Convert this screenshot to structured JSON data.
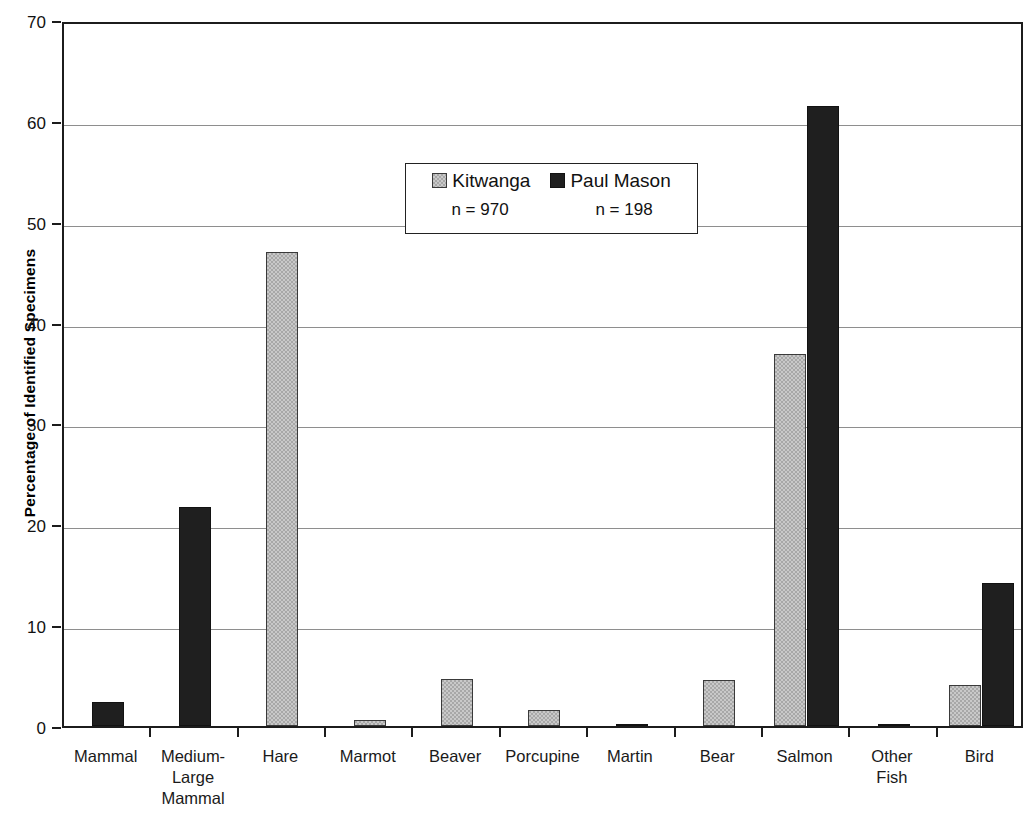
{
  "chart_data": {
    "type": "bar",
    "title": "",
    "xlabel": "",
    "ylabel": "Percentage of Identified Specimens",
    "ylim": [
      0,
      70
    ],
    "ytick_labels": [
      "0",
      "10",
      "20",
      "30",
      "40",
      "50",
      "60",
      "70"
    ],
    "yticks": [
      0,
      10,
      20,
      30,
      40,
      50,
      60,
      70
    ],
    "grid": true,
    "legend_position": "upper center",
    "categories": [
      "Mammal",
      "Medium-Large Mammal",
      "Hare",
      "Marmot",
      "Beaver",
      "Porcupine",
      "Martin",
      "Bear",
      "Salmon",
      "Other Fish",
      "Bird"
    ],
    "category_label_lines": [
      [
        "Mammal"
      ],
      [
        "Medium-",
        "Large",
        "Mammal"
      ],
      [
        "Hare"
      ],
      [
        "Marmot"
      ],
      [
        "Beaver"
      ],
      [
        "Porcupine"
      ],
      [
        "Martin"
      ],
      [
        "Bear"
      ],
      [
        "Salmon"
      ],
      [
        "Other",
        "Fish"
      ],
      [
        "Bird"
      ]
    ],
    "series": [
      {
        "name": "Kitwanga",
        "n_label": "n = 970",
        "color": "#a8a8a8",
        "values": [
          0,
          0,
          47.0,
          0.6,
          4.7,
          1.6,
          0,
          4.6,
          36.9,
          0,
          4.1
        ]
      },
      {
        "name": "Paul Mason",
        "n_label": "n = 198",
        "color": "#1f1f1f",
        "values": [
          2.4,
          21.7,
          0,
          0,
          0,
          0,
          0.2,
          0,
          61.5,
          0.2,
          14.2
        ]
      }
    ]
  },
  "legend": {
    "entries": [
      {
        "label": "Kitwanga",
        "n": "n = 970"
      },
      {
        "label": "Paul Mason",
        "n": "n = 198"
      }
    ]
  },
  "axis": {
    "y_title": "Percentage of Identified Specimens"
  }
}
